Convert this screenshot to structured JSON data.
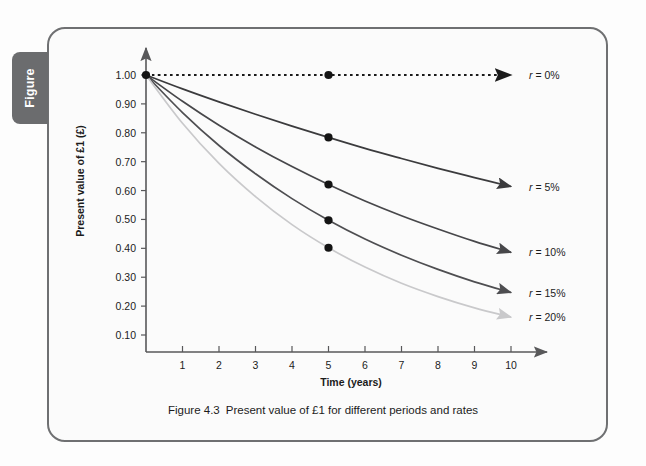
{
  "tab": {
    "label": "Figure"
  },
  "caption": {
    "number": "Figure 4.3",
    "text": "Present value of £1 for different periods and rates"
  },
  "axes": {
    "y_title": "Present value of £1 (£)",
    "x_title": "Time (years)",
    "y_ticks": [
      "1.00",
      "0.90",
      "0.80",
      "0.70",
      "0.60",
      "0.50",
      "0.40",
      "0.30",
      "0.20",
      "0.10"
    ],
    "x_ticks": [
      "1",
      "2",
      "3",
      "4",
      "5",
      "6",
      "7",
      "8",
      "9",
      "10"
    ]
  },
  "legend": [
    {
      "label": "r = 0%",
      "rate": 0
    },
    {
      "label": "r = 5%",
      "rate": 5
    },
    {
      "label": "r = 10%",
      "rate": 10
    },
    {
      "label": "r = 15%",
      "rate": 15
    },
    {
      "label": "r = 20%",
      "rate": 20
    }
  ],
  "colors": {
    "page_background": "#fdfdfd",
    "panel_background": "#fbfbfb",
    "box_border": "#6f7072",
    "tab_background": "#6b6c6e",
    "tab_text": "#ffffff",
    "axis": "#58585a",
    "text": "#1b1b1b",
    "curve_0": "#1a1a1a",
    "curve_5": "#3b3b3d",
    "curve_10": "#47474a",
    "curve_15": "#4e4e51",
    "curve_20": "#c9c9cb",
    "marker": "#141414"
  },
  "chart_data": {
    "type": "line",
    "title": "Present value of £1 for different periods and rates",
    "xlabel": "Time (years)",
    "ylabel": "Present value of £1 (£)",
    "xlim": [
      0,
      10
    ],
    "ylim": [
      0,
      1.0
    ],
    "grid": false,
    "legend_position": "right",
    "x": [
      0,
      1,
      2,
      3,
      4,
      5,
      6,
      7,
      8,
      9,
      10
    ],
    "series": [
      {
        "name": "r = 0%",
        "rate": 0,
        "style": "dotted",
        "color": "#1a1a1a",
        "values": [
          1.0,
          1.0,
          1.0,
          1.0,
          1.0,
          1.0,
          1.0,
          1.0,
          1.0,
          1.0,
          1.0
        ]
      },
      {
        "name": "r = 5%",
        "rate": 5,
        "style": "solid",
        "color": "#3b3b3d",
        "values": [
          1.0,
          0.952,
          0.907,
          0.864,
          0.823,
          0.784,
          0.746,
          0.711,
          0.677,
          0.645,
          0.614
        ]
      },
      {
        "name": "r = 10%",
        "rate": 10,
        "style": "solid",
        "color": "#47474a",
        "values": [
          1.0,
          0.909,
          0.826,
          0.751,
          0.683,
          0.621,
          0.564,
          0.513,
          0.467,
          0.424,
          0.386
        ]
      },
      {
        "name": "r = 15%",
        "rate": 15,
        "style": "solid",
        "color": "#4e4e51",
        "values": [
          1.0,
          0.87,
          0.756,
          0.658,
          0.572,
          0.497,
          0.432,
          0.376,
          0.327,
          0.284,
          0.247
        ]
      },
      {
        "name": "r = 20%",
        "rate": 20,
        "style": "solid",
        "color": "#c9c9cb",
        "values": [
          1.0,
          0.833,
          0.694,
          0.579,
          0.482,
          0.402,
          0.335,
          0.279,
          0.233,
          0.194,
          0.162
        ]
      }
    ],
    "markers": [
      {
        "series": "r = 0%",
        "x": 0,
        "y": 1.0
      },
      {
        "series": "r = 0%",
        "x": 5,
        "y": 1.0
      },
      {
        "series": "r = 5%",
        "x": 5,
        "y": 0.784
      },
      {
        "series": "r = 10%",
        "x": 5,
        "y": 0.621
      },
      {
        "series": "r = 15%",
        "x": 5,
        "y": 0.497
      },
      {
        "series": "r = 20%",
        "x": 5,
        "y": 0.402
      }
    ],
    "annotations": [
      {
        "text": "r = 0%",
        "at_x": 10,
        "at_y": 1.0
      },
      {
        "text": "r = 5%",
        "at_x": 10,
        "at_y": 0.614
      },
      {
        "text": "r = 10%",
        "at_x": 10,
        "at_y": 0.386
      },
      {
        "text": "r = 15%",
        "at_x": 10,
        "at_y": 0.247
      },
      {
        "text": "r = 20%",
        "at_x": 10,
        "at_y": 0.162
      }
    ]
  }
}
